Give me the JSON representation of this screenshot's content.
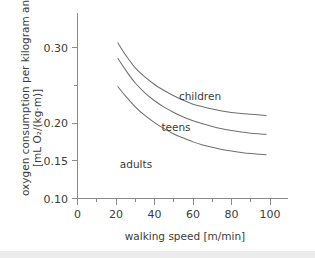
{
  "chart_data": {
    "type": "line",
    "title": "",
    "xlabel": "walking speed  [m/min]",
    "ylabel_line1": "oxygen consumption per kilogram and meter",
    "ylabel_line2": "[mL O₂/(kg·m)]",
    "xlim": [
      0,
      110
    ],
    "ylim": [
      0.1,
      0.325
    ],
    "grid": false,
    "legend": "inline-curve-labels",
    "xticks": [
      0,
      20,
      40,
      60,
      80,
      100
    ],
    "xticklabels": [
      "0",
      "20",
      "40",
      "60",
      "80",
      "100"
    ],
    "xminorticks": [
      10,
      30,
      50,
      70,
      90
    ],
    "yticks": [
      0.1,
      0.15,
      0.2,
      0.3
    ],
    "yticklabels": [
      "0.10",
      "0.15",
      "0.20",
      "0.30"
    ],
    "yminorticks": [
      0.25
    ],
    "x": [
      21,
      25,
      30,
      35,
      40,
      45,
      50,
      55,
      60,
      65,
      70,
      75,
      80,
      85,
      90,
      95,
      98
    ],
    "series": [
      {
        "name": "children",
        "label": "children",
        "color": "#6e6e6e",
        "values": [
          0.306,
          0.29,
          0.273,
          0.261,
          0.251,
          0.243,
          0.236,
          0.23,
          0.225,
          0.2215,
          0.2185,
          0.216,
          0.214,
          0.2125,
          0.2115,
          0.2105,
          0.21
        ]
      },
      {
        "name": "teens",
        "label": "teens",
        "color": "#6e6e6e",
        "values": [
          0.2855,
          0.27,
          0.253,
          0.24,
          0.2295,
          0.221,
          0.214,
          0.208,
          0.203,
          0.199,
          0.1955,
          0.1925,
          0.19,
          0.188,
          0.1865,
          0.1855,
          0.185
        ]
      },
      {
        "name": "adults",
        "label": "adults",
        "color": "#6e6e6e",
        "values": [
          0.248,
          0.2355,
          0.2215,
          0.21,
          0.2005,
          0.1925,
          0.1855,
          0.18,
          0.175,
          0.171,
          0.1678,
          0.165,
          0.1628,
          0.161,
          0.1595,
          0.1585,
          0.158
        ]
      }
    ],
    "curve_labels": [
      {
        "name": "children",
        "text": "children",
        "x": 200,
        "y": 100
      },
      {
        "name": "teens",
        "text": "teens",
        "x": 176,
        "y": 131
      },
      {
        "name": "adults",
        "text": "adults",
        "x": 136,
        "y": 168
      }
    ]
  },
  "axis": {
    "x_title": "walking speed  [m/min]",
    "y_title_line1": "oxygen consumption per kilogram and meter",
    "y_title_line2": "[mL O₂/(kg·m)]"
  },
  "colors": {
    "curve": "#6e6e6e",
    "axis": "#8a8a8a",
    "text": "#3b3b3b",
    "background": "#ffffff",
    "footer_band": "#ececed"
  }
}
